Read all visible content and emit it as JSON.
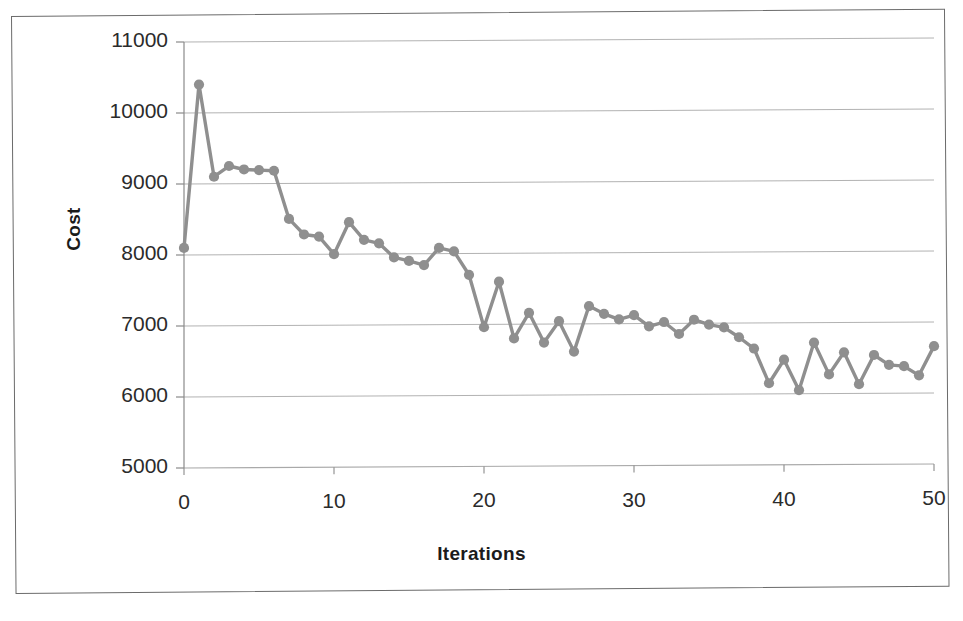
{
  "chart_data": {
    "type": "line",
    "title": "",
    "xlabel": "Iterations",
    "ylabel": "Cost",
    "xlim": [
      0,
      50
    ],
    "ylim": [
      5000,
      11000
    ],
    "xticks": [
      0,
      10,
      20,
      30,
      40,
      50
    ],
    "yticks": [
      5000,
      6000,
      7000,
      8000,
      9000,
      10000,
      11000
    ],
    "xtick_labels": [
      "0",
      "10",
      "20",
      "30",
      "40",
      "50"
    ],
    "ytick_labels": [
      "5000",
      "6000",
      "7000",
      "8000",
      "9000",
      "10000",
      "11000"
    ],
    "grid": "horizontal",
    "legend": "none",
    "marker": "circle",
    "series": [
      {
        "name": "Cost",
        "color": "#8f8f8f",
        "x": [
          0,
          1,
          2,
          3,
          4,
          5,
          6,
          7,
          8,
          9,
          10,
          11,
          12,
          13,
          14,
          15,
          16,
          17,
          18,
          19,
          20,
          21,
          22,
          23,
          24,
          25,
          26,
          27,
          28,
          29,
          30,
          31,
          32,
          33,
          34,
          35,
          36,
          37,
          38,
          39,
          40,
          41,
          42,
          43,
          44,
          45,
          46,
          47,
          48,
          49,
          50
        ],
        "values": [
          8100,
          10400,
          9100,
          9250,
          9200,
          9190,
          9180,
          8500,
          8280,
          8250,
          8000,
          8450,
          8200,
          8150,
          7950,
          7900,
          7840,
          8080,
          8030,
          7700,
          6960,
          7600,
          6800,
          7160,
          6740,
          7040,
          6610,
          7250,
          7140,
          7060,
          7120,
          6960,
          7020,
          6850,
          7050,
          6980,
          6940,
          6800,
          6640,
          6150,
          6480,
          6050,
          6720,
          6270,
          6580,
          6130,
          6540,
          6400,
          6380,
          6250,
          6660
        ]
      }
    ]
  },
  "axis_titles": {
    "y": "Cost",
    "x": "Iterations"
  },
  "style": {
    "series_color": "#8f8f8f",
    "grid_color": "#a9a9a9",
    "axis_color": "#8a8a8a",
    "tick_text_color": "#2b2b2b",
    "frame_color": "#6b6b6b",
    "background": "#ffffff"
  }
}
